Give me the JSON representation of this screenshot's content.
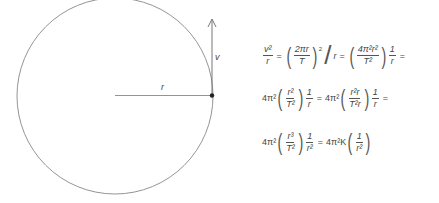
{
  "diagram": {
    "circle": {
      "cx": 115,
      "cy": 96,
      "r": 98
    },
    "radius_label": "r",
    "velocity_label": "v",
    "stroke_color": "#777777"
  },
  "equations": {
    "line1": {
      "lhs_num": "v²",
      "lhs_den": "r",
      "t1_num": "2πr",
      "t1_den": "T",
      "t1_exp": "2",
      "div": "r",
      "t2_num": "4π²r²",
      "t2_den": "T²",
      "t3_num": "1",
      "t3_den": "r"
    },
    "line2": {
      "coef1": "4π²",
      "a_num": "r²",
      "a_den": "T²",
      "b_num": "1",
      "b_den": "r",
      "coef2": "4π²",
      "c_num": "r²r",
      "c_den": "T²r",
      "d_num": "1",
      "d_den": "r"
    },
    "line3": {
      "coef1": "4π²",
      "a_num": "r³",
      "a_den": "T²",
      "b_num": "1",
      "b_den": "r²",
      "coef2": "4π²K",
      "c_num": "1",
      "c_den": "r²"
    },
    "equals": "="
  }
}
